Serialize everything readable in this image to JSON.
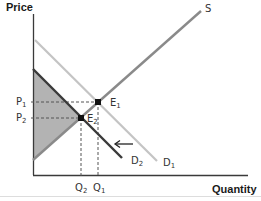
{
  "diagram": {
    "type": "supply-demand",
    "axes": {
      "y_label": "Price",
      "x_label": "Quantity"
    },
    "curves": {
      "supply": {
        "label": "S",
        "color": "#8a8a8a"
      },
      "demand_1": {
        "label": "D",
        "sub": "1",
        "color": "#c4c4c4"
      },
      "demand_2": {
        "label": "D",
        "sub": "2",
        "color": "#3a3a3a"
      }
    },
    "points": {
      "e1": {
        "label": "E",
        "sub": "1"
      },
      "e2": {
        "label": "E",
        "sub": "2"
      }
    },
    "price_ticks": [
      {
        "label": "P",
        "sub": "1"
      },
      {
        "label": "P",
        "sub": "2"
      }
    ],
    "quantity_ticks": [
      {
        "label": "Q",
        "sub": "2"
      },
      {
        "label": "Q",
        "sub": "1"
      }
    ],
    "shift_arrow": {
      "direction": "left"
    },
    "shaded_region": {
      "color": "#b3b3b3",
      "description": "area between D2 and S left of E2"
    }
  }
}
